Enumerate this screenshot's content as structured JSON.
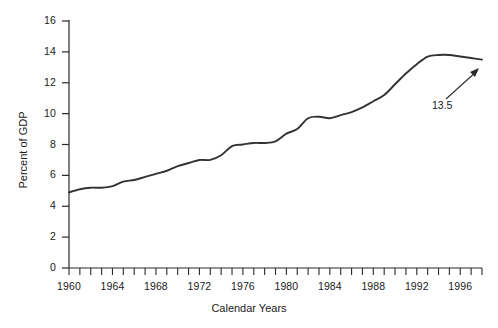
{
  "chart_data": {
    "type": "line",
    "title": "",
    "xlabel": "Calendar Years",
    "ylabel": "Percent of GDP",
    "xlim": [
      1960,
      1998
    ],
    "ylim": [
      0,
      16
    ],
    "grid": false,
    "legend": null,
    "y_ticks": [
      0,
      2,
      4,
      6,
      8,
      10,
      12,
      14,
      16
    ],
    "y_tick_labels": [
      "0",
      "2",
      "4",
      "6",
      "8",
      "10",
      "12",
      "14",
      "16"
    ],
    "x_ticks": [
      1960,
      1961,
      1962,
      1963,
      1964,
      1965,
      1966,
      1967,
      1968,
      1969,
      1970,
      1971,
      1972,
      1973,
      1974,
      1975,
      1976,
      1977,
      1978,
      1979,
      1980,
      1981,
      1982,
      1983,
      1984,
      1985,
      1986,
      1987,
      1988,
      1989,
      1990,
      1991,
      1992,
      1993,
      1994,
      1995,
      1996,
      1997,
      1998
    ],
    "x_tick_labels": [
      "1960",
      "1964",
      "1968",
      "1972",
      "1976",
      "1980",
      "1984",
      "1988",
      "1992",
      "1996"
    ],
    "x_tick_label_values": [
      1960,
      1964,
      1968,
      1972,
      1976,
      1980,
      1984,
      1988,
      1992,
      1996
    ],
    "minor_x_ticks": true,
    "series": [
      {
        "name": "Percent of GDP",
        "color": "#333333",
        "x": [
          1960,
          1961,
          1962,
          1963,
          1964,
          1965,
          1966,
          1967,
          1968,
          1969,
          1970,
          1971,
          1972,
          1973,
          1974,
          1975,
          1976,
          1977,
          1978,
          1979,
          1980,
          1981,
          1982,
          1983,
          1984,
          1985,
          1986,
          1987,
          1988,
          1989,
          1990,
          1991,
          1992,
          1993,
          1994,
          1995,
          1996,
          1997,
          1998
        ],
        "values": [
          4.9,
          5.1,
          5.2,
          5.2,
          5.3,
          5.6,
          5.7,
          5.9,
          6.1,
          6.3,
          6.6,
          6.8,
          7.0,
          7.0,
          7.3,
          7.9,
          8.0,
          8.1,
          8.1,
          8.2,
          8.7,
          9.0,
          9.7,
          9.8,
          9.7,
          9.9,
          10.1,
          10.4,
          10.8,
          11.2,
          11.9,
          12.6,
          13.2,
          13.7,
          13.8,
          13.8,
          13.7,
          13.6,
          13.5
        ]
      }
    ],
    "annotations": [
      {
        "text": "13.5",
        "points_to_x": 1998,
        "points_to_y": 13.5,
        "type": "arrow-label"
      }
    ]
  },
  "axes": {
    "y_title": "Percent of GDP",
    "x_title": "Calendar Years"
  }
}
